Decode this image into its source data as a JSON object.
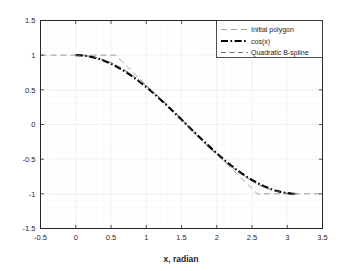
{
  "chart_data": {
    "type": "line",
    "title": "",
    "xlabel": "x, radian",
    "ylabel": "",
    "xlim": [
      -0.5,
      3.5
    ],
    "ylim": [
      -1.5,
      1.5
    ],
    "xticks": [
      "-0.5",
      "0",
      "0.5",
      "1",
      "1.5",
      "2",
      "2.5",
      "3",
      "3.5"
    ],
    "xtick_values": [
      -0.5,
      0,
      0.5,
      1,
      1.5,
      2,
      2.5,
      3,
      3.5
    ],
    "yticks": [
      "1.5",
      "1",
      "0.5",
      "0",
      "-0.5",
      "-1",
      "-1.5"
    ],
    "ytick_values": [
      1.5,
      1,
      0.5,
      0,
      -0.5,
      -1,
      -1.5
    ],
    "grid": true,
    "grid_minor": true,
    "legend_position": "upper right",
    "background": "#ffffff",
    "axis_color": "#262626",
    "grid_color": "#f0f0f0",
    "series": [
      {
        "name": "Initial polygon",
        "style": "dashed",
        "color": "#8c8c8c",
        "width": 0.8,
        "points": [
          [
            -0.5,
            1.0
          ],
          [
            0.0,
            1.0
          ],
          [
            0.5655,
            1.0
          ],
          [
            1.5708,
            0.0
          ],
          [
            2.5761,
            -1.0
          ],
          [
            3.1416,
            -1.0
          ],
          [
            3.5,
            -1.0
          ]
        ]
      },
      {
        "name": "cos(x)",
        "style": "dashdot",
        "color": "#000000",
        "width": 2.2,
        "x": [
          0.0,
          0.0785,
          0.1571,
          0.2356,
          0.3142,
          0.3927,
          0.4712,
          0.5498,
          0.6283,
          0.7069,
          0.7854,
          0.8639,
          0.9425,
          1.021,
          1.0996,
          1.1781,
          1.2566,
          1.3352,
          1.4137,
          1.4923,
          1.5708,
          1.6493,
          1.7279,
          1.8064,
          1.885,
          1.9635,
          2.042,
          2.1206,
          2.1991,
          2.2777,
          2.3562,
          2.4347,
          2.5133,
          2.5918,
          2.6704,
          2.7489,
          2.8274,
          2.906,
          2.9845,
          3.0631,
          3.1416
        ],
        "y": [
          1.0,
          0.9969,
          0.9877,
          0.9724,
          0.9511,
          0.9239,
          0.891,
          0.8526,
          0.809,
          0.7604,
          0.7071,
          0.6494,
          0.5878,
          0.5225,
          0.454,
          0.3827,
          0.309,
          0.2334,
          0.1564,
          0.0785,
          0.0,
          -0.0785,
          -0.1564,
          -0.2334,
          -0.309,
          -0.3827,
          -0.454,
          -0.5225,
          -0.5878,
          -0.6494,
          -0.7071,
          -0.7604,
          -0.809,
          -0.8526,
          -0.891,
          -0.9239,
          -0.9511,
          -0.9724,
          -0.9877,
          -0.9969,
          -1.0
        ]
      },
      {
        "name": "Quadratic B-spline",
        "style": "dashed-thin",
        "color": "#595959",
        "width": 0.9,
        "x": [
          0.0,
          0.0785,
          0.1571,
          0.2356,
          0.3142,
          0.3927,
          0.4712,
          0.5498,
          0.6283,
          0.7069,
          0.7854,
          0.8639,
          0.9425,
          1.021,
          1.0996,
          1.1781,
          1.2566,
          1.3352,
          1.4137,
          1.4923,
          1.5708,
          1.6493,
          1.7279,
          1.8064,
          1.885,
          1.9635,
          2.042,
          2.1206,
          2.1991,
          2.2777,
          2.3562,
          2.4347,
          2.5133,
          2.5918,
          2.6704,
          2.7489,
          2.8274,
          2.906,
          2.9845,
          3.0631,
          3.1416
        ],
        "y": [
          1.0,
          0.9975,
          0.99,
          0.9768,
          0.9578,
          0.9329,
          0.9019,
          0.865,
          0.8221,
          0.7739,
          0.7208,
          0.6633,
          0.6018,
          0.5368,
          0.4686,
          0.3975,
          0.324,
          0.2485,
          0.1714,
          0.0861,
          0.0,
          -0.0861,
          -0.1714,
          -0.2485,
          -0.324,
          -0.3975,
          -0.4686,
          -0.5368,
          -0.6018,
          -0.6633,
          -0.7208,
          -0.7739,
          -0.8221,
          -0.865,
          -0.9019,
          -0.9329,
          -0.9578,
          -0.9768,
          -0.99,
          -0.9975,
          -1.0
        ]
      }
    ]
  },
  "legend": {
    "items": [
      {
        "label": "Initial polygon"
      },
      {
        "label": "cos(x)"
      },
      {
        "label": "Quadratic B-spline"
      }
    ]
  },
  "axes": {
    "xlabel": "x, radian"
  }
}
